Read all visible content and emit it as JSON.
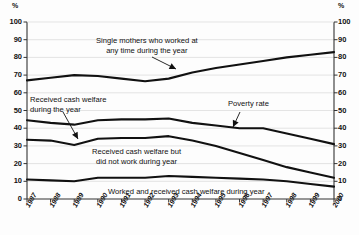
{
  "chart_data": {
    "type": "line",
    "title": "",
    "xlabel": "",
    "ylabel": "%",
    "axis_unit_left": "%",
    "axis_unit_right": "%",
    "ylim": [
      0,
      100
    ],
    "yticks": [
      0,
      10,
      20,
      30,
      40,
      50,
      60,
      70,
      80,
      90,
      100
    ],
    "grid": true,
    "legend": "none",
    "dual_axis": true,
    "categories": [
      "1987",
      "1988",
      "1989",
      "1990",
      "1991",
      "1992",
      "1993",
      "1994",
      "1995",
      "1996",
      "1997",
      "1998",
      "1999",
      "2000"
    ],
    "series": [
      {
        "name": "Single mothers who worked at any time during the year",
        "values": [
          67,
          68.5,
          70,
          69.5,
          68,
          66.5,
          68,
          71.5,
          74,
          76,
          78,
          80,
          81.5,
          83
        ]
      },
      {
        "name": "Poverty rate",
        "values": [
          44.5,
          43,
          42,
          44.5,
          45,
          45,
          45.5,
          43,
          41.5,
          40,
          40,
          37,
          34,
          31
        ]
      },
      {
        "name": "Received cash welfare during the year",
        "values": [
          33.5,
          33,
          30.5,
          34,
          34.5,
          34.5,
          35.5,
          33,
          30,
          26,
          22,
          18,
          15,
          12
        ]
      },
      {
        "name": "Worked and received cash welfare during year",
        "values": [
          11,
          10.5,
          10,
          12,
          12,
          12,
          13,
          12.5,
          12,
          11.5,
          11,
          10,
          8.5,
          7
        ]
      }
    ],
    "annotations": [
      {
        "id": "anno-worked-any-time",
        "line1": "Single mothers who worked at",
        "line2": "any time during the year"
      },
      {
        "id": "anno-received-cash-welfare",
        "line1": "Received cash welfare",
        "line2": "during the year"
      },
      {
        "id": "anno-poverty-rate",
        "line1": "Poverty rate",
        "line2": ""
      },
      {
        "id": "anno-welfare-not-work",
        "line1": "Received cash welfare but",
        "line2": "did not work during year"
      },
      {
        "id": "anno-worked-and-welfare",
        "line1": "Worked and received cash welfare during year",
        "line2": ""
      }
    ],
    "colors": {
      "line": "#111111",
      "grid": "#d9d9d9",
      "axis": "#333333",
      "background": "#fdfdfd"
    }
  },
  "ticks": {
    "y": [
      "100",
      "90",
      "80",
      "70",
      "60",
      "50",
      "40",
      "30",
      "20",
      "10",
      "0"
    ],
    "x": [
      "1987",
      "1988",
      "1989",
      "1990",
      "1991",
      "1992",
      "1993",
      "1994",
      "1995",
      "1996",
      "1997",
      "1998",
      "1999",
      "2000"
    ],
    "unit": "%"
  }
}
